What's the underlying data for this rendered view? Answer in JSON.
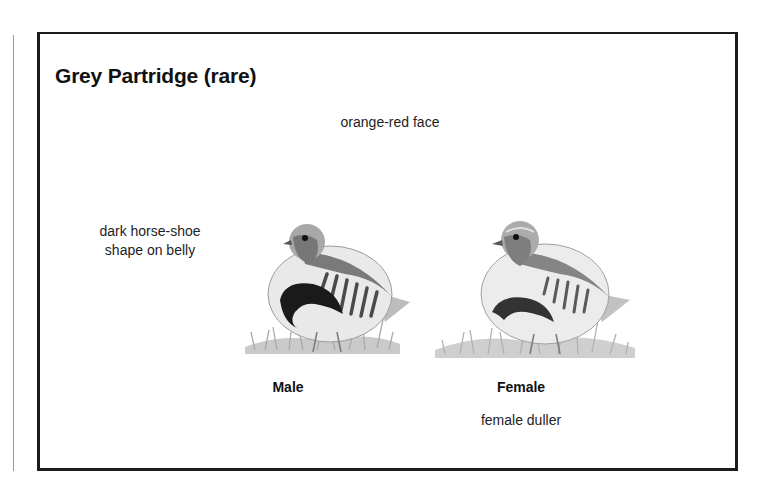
{
  "page": {
    "title": "Grey Partridge (rare)",
    "annotations": {
      "face": "orange-red face",
      "belly_line1": "dark horse-shoe",
      "belly_line2": "shape on belly",
      "female_note": "female duller"
    },
    "figures": [
      {
        "caption": "Male",
        "icon": "male-partridge-illustration"
      },
      {
        "caption": "Female",
        "icon": "female-partridge-illustration"
      }
    ]
  }
}
